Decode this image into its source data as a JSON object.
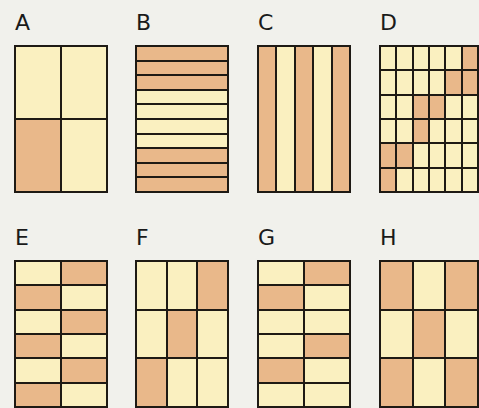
{
  "colors": {
    "shaded": "#e9b88a",
    "unshaded": "#faf0c0",
    "border": "#1e1a14",
    "background": "#f1f1ec"
  },
  "panels": [
    {
      "label": "A",
      "x": 14,
      "y": 45,
      "w": 94,
      "h": 148,
      "rows": 2,
      "cols": 2,
      "shaded": [
        [
          0,
          0
        ],
        [
          1,
          0
        ]
      ],
      "grid": [
        [
          0,
          0
        ],
        [
          1,
          0
        ]
      ]
    },
    {
      "label": "B",
      "x": 135,
      "y": 45,
      "w": 94,
      "h": 148,
      "rows": 10,
      "cols": 1,
      "grid": [
        [
          1
        ],
        [
          1
        ],
        [
          1
        ],
        [
          0
        ],
        [
          0
        ],
        [
          0
        ],
        [
          0
        ],
        [
          1
        ],
        [
          1
        ],
        [
          1
        ]
      ]
    },
    {
      "label": "C",
      "x": 257,
      "y": 45,
      "w": 94,
      "h": 148,
      "rows": 1,
      "cols": 5,
      "grid": [
        [
          1,
          0,
          1,
          0,
          1
        ]
      ]
    },
    {
      "label": "D",
      "x": 379,
      "y": 45,
      "w": 100,
      "h": 148,
      "rows": 6,
      "cols": 6,
      "grid": [
        [
          0,
          0,
          0,
          0,
          0,
          1
        ],
        [
          0,
          0,
          0,
          0,
          1,
          1
        ],
        [
          0,
          0,
          1,
          1,
          0,
          0
        ],
        [
          0,
          0,
          1,
          0,
          0,
          0
        ],
        [
          1,
          1,
          0,
          0,
          0,
          0
        ],
        [
          1,
          0,
          0,
          0,
          0,
          0
        ]
      ]
    },
    {
      "label": "E",
      "x": 14,
      "y": 260,
      "w": 94,
      "h": 148,
      "rows": 6,
      "cols": 2,
      "grid": [
        [
          0,
          1
        ],
        [
          1,
          0
        ],
        [
          0,
          1
        ],
        [
          1,
          0
        ],
        [
          0,
          1
        ],
        [
          1,
          0
        ]
      ]
    },
    {
      "label": "F",
      "x": 135,
      "y": 260,
      "w": 94,
      "h": 148,
      "rows": 3,
      "cols": 3,
      "grid": [
        [
          0,
          0,
          1
        ],
        [
          0,
          1,
          0
        ],
        [
          1,
          0,
          0
        ]
      ]
    },
    {
      "label": "G",
      "x": 257,
      "y": 260,
      "w": 94,
      "h": 148,
      "rows": 6,
      "cols": 2,
      "grid": [
        [
          0,
          1
        ],
        [
          1,
          0
        ],
        [
          0,
          0
        ],
        [
          0,
          1
        ],
        [
          1,
          0
        ],
        [
          0,
          0
        ]
      ]
    },
    {
      "label": "H",
      "x": 379,
      "y": 260,
      "w": 100,
      "h": 148,
      "rows": 3,
      "cols": 3,
      "grid": [
        [
          1,
          0,
          1
        ],
        [
          0,
          1,
          0
        ],
        [
          1,
          0,
          1
        ]
      ]
    }
  ]
}
